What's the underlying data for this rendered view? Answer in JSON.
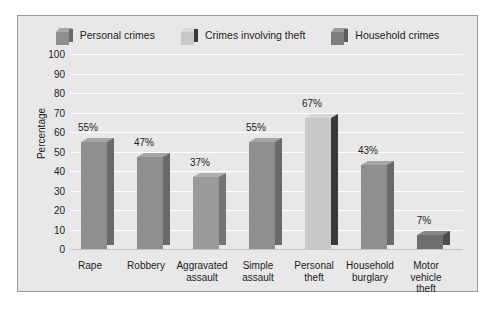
{
  "chart_data": {
    "type": "bar",
    "title": "",
    "xlabel": "",
    "ylabel": "Percentage",
    "ylim": [
      0,
      100
    ],
    "ytick_step": 10,
    "grid": true,
    "legend_position": "top",
    "categories": [
      "Rape",
      "Robbery",
      "Aggravated assault",
      "Simple assault",
      "Personal theft",
      "Household burglary",
      "Motor vehicle theft"
    ],
    "category_lines": [
      [
        "Rape"
      ],
      [
        "Robbery"
      ],
      [
        "Aggravated",
        "assault"
      ],
      [
        "Simple",
        "assault"
      ],
      [
        "Personal",
        "theft"
      ],
      [
        "Household",
        "burglary"
      ],
      [
        "Motor",
        "vehicle",
        "theft"
      ]
    ],
    "values": [
      55,
      47,
      37,
      55,
      67,
      43,
      7
    ],
    "value_labels": [
      "55%",
      "47%",
      "37%",
      "55%",
      "67%",
      "43%",
      "7%"
    ],
    "series_of_bar": [
      "Personal crimes",
      "Personal crimes",
      "Personal crimes",
      "Personal crimes",
      "Crimes involving theft",
      "Household crimes",
      "Household crimes"
    ],
    "ytick_labels": [
      "100",
      "90",
      "80",
      "70",
      "60",
      "50",
      "40",
      "30",
      "20",
      "10",
      "0"
    ],
    "ytick_values": [
      100,
      90,
      80,
      70,
      60,
      50,
      40,
      30,
      20,
      10,
      0
    ]
  },
  "legend": {
    "items": [
      {
        "label": "Personal crimes",
        "color": "#8e8e8e",
        "side_color": "#6a6a6a",
        "top_color": "#a8a8a8"
      },
      {
        "label": "Crimes involving theft",
        "color": "#c8c8c8",
        "side_color": "#3a3a3a",
        "top_color": "#d8d8d8"
      },
      {
        "label": "Household crimes",
        "color": "#7e7e7e",
        "side_color": "#5c5c5c",
        "top_color": "#9a9a9a"
      }
    ]
  },
  "colors": {
    "panel_background": "#e8e8e8",
    "panel_border": "#9a9a9a",
    "gridline": "#ffffff",
    "baseline": "#c3c3c3",
    "text": "#1c1c1c",
    "page_background": "#ffffff"
  },
  "bar_styles": [
    {
      "color": "#8e8e8e",
      "side_color": "#6a6a6a",
      "top_color": "#a6a6a6"
    },
    {
      "color": "#8e8e8e",
      "side_color": "#6a6a6a",
      "top_color": "#a6a6a6"
    },
    {
      "color": "#9a9a9a",
      "side_color": "#747474",
      "top_color": "#b0b0b0"
    },
    {
      "color": "#8e8e8e",
      "side_color": "#6a6a6a",
      "top_color": "#a6a6a6"
    },
    {
      "color": "#c8c8c8",
      "side_color": "#3a3a3a",
      "top_color": "#d6d6d6"
    },
    {
      "color": "#8e8e8e",
      "side_color": "#6a6a6a",
      "top_color": "#a6a6a6"
    },
    {
      "color": "#6e6e6e",
      "side_color": "#4e4e4e",
      "top_color": "#888888"
    }
  ]
}
